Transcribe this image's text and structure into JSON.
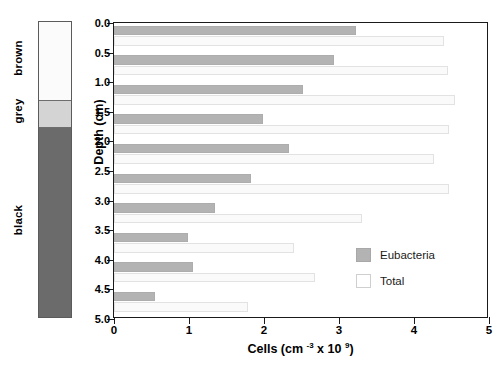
{
  "core": {
    "zones": [
      {
        "name": "brown",
        "label": "brown",
        "color": "#fbfbfb",
        "top_cm": 0.0,
        "bottom_cm": 1.33
      },
      {
        "name": "grey",
        "label": "grey",
        "color": "#d4d4d4",
        "top_cm": 1.33,
        "bottom_cm": 1.79
      },
      {
        "name": "black",
        "label": "black",
        "color": "#6b6b6b",
        "top_cm": 1.79,
        "bottom_cm": 5.0
      }
    ]
  },
  "chart_data": {
    "type": "bar",
    "orientation": "horizontal",
    "title": "",
    "xlabel": "Cells (cm -3 x 10 9)",
    "xlabel_parts": {
      "prefix": "Cells (cm ",
      "sup1": "-3",
      "mid": " x 10 ",
      "sup2": "9",
      "suffix": ")"
    },
    "ylabel": "Depth (cm)",
    "xlim": [
      0,
      5
    ],
    "ylim": [
      0,
      5
    ],
    "xticks": [
      0,
      1,
      2,
      3,
      4,
      5
    ],
    "xtick_labels": [
      "0",
      "1",
      "2",
      "3",
      "4",
      "5"
    ],
    "yticks": [
      0.0,
      0.5,
      1.0,
      1.5,
      2.0,
      2.5,
      3.0,
      3.5,
      4.0,
      4.5,
      5.0
    ],
    "ytick_labels": [
      "0.0",
      "0.5",
      "1.0",
      "1.5",
      "2.0",
      "2.5",
      "3.0",
      "3.5",
      "4.0",
      "4.5",
      "5.0"
    ],
    "grid": false,
    "legend_position": "lower right",
    "depths": [
      0.25,
      0.75,
      1.25,
      1.75,
      2.25,
      2.75,
      3.25,
      3.75,
      4.25,
      4.75
    ],
    "series": [
      {
        "name": "Eubacteria",
        "color": "#b3b3b3",
        "values": [
          3.22,
          2.93,
          2.52,
          1.99,
          2.33,
          1.82,
          1.35,
          0.99,
          1.05,
          0.55
        ]
      },
      {
        "name": "Total",
        "color": "#fafafa",
        "values": [
          4.4,
          4.45,
          4.55,
          4.46,
          4.27,
          4.47,
          3.3,
          2.4,
          2.68,
          1.79
        ]
      }
    ]
  },
  "legend": {
    "items": [
      {
        "label": "Eubacteria",
        "swatch": "eub"
      },
      {
        "label": "Total",
        "swatch": "total"
      }
    ]
  }
}
